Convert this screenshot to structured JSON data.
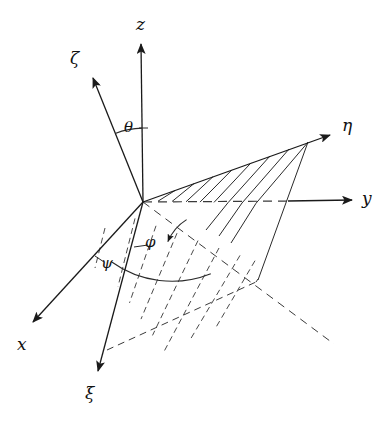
{
  "figure": {
    "kind": "euler-angles-diagram",
    "background_color": "#ffffff",
    "line_color": "#1a1a1a",
    "width": 392,
    "height": 421
  },
  "origin": {
    "x": 143,
    "y": 202
  },
  "axes": [
    {
      "id": "z",
      "label": "z",
      "frame": "fixed",
      "style": "solid",
      "from": {
        "x": 143,
        "y": 202
      },
      "to": {
        "x": 141,
        "y": 40
      },
      "label_pos": {
        "x": 136,
        "y": 16
      }
    },
    {
      "id": "y",
      "label": "y",
      "frame": "fixed",
      "style": "dashed-then-solid",
      "from": {
        "x": 143,
        "y": 202
      },
      "to": {
        "x": 355,
        "y": 200
      },
      "dash_end": {
        "x": 291,
        "y": 201
      },
      "label_pos": {
        "x": 362,
        "y": 190
      }
    },
    {
      "id": "x",
      "label": "x",
      "frame": "fixed",
      "style": "solid",
      "from": {
        "x": 143,
        "y": 202
      },
      "to": {
        "x": 30,
        "y": 325
      },
      "label_pos": {
        "x": 17,
        "y": 336
      }
    },
    {
      "id": "zeta",
      "label": "ζ",
      "frame": "body",
      "style": "solid",
      "from": {
        "x": 143,
        "y": 202
      },
      "to": {
        "x": 91,
        "y": 74
      },
      "label_pos": {
        "x": 70,
        "y": 50
      }
    },
    {
      "id": "eta",
      "label": "η",
      "frame": "body",
      "style": "solid",
      "from": {
        "x": 143,
        "y": 202
      },
      "to": {
        "x": 333,
        "y": 133
      },
      "label_pos": {
        "x": 342,
        "y": 117
      }
    },
    {
      "id": "xi",
      "label": "ξ",
      "frame": "body",
      "style": "solid",
      "from": {
        "x": 143,
        "y": 202
      },
      "to": {
        "x": 96,
        "y": 376
      },
      "label_pos": {
        "x": 85,
        "y": 385
      }
    }
  ],
  "angles": [
    {
      "id": "theta",
      "label": "θ",
      "between": [
        "zeta",
        "z"
      ],
      "label_pos": {
        "x": 124,
        "y": 120
      },
      "arc": {
        "cx": 143,
        "cy": 202,
        "r": 74,
        "from_deg": 248,
        "to_deg": 271
      }
    },
    {
      "id": "phi",
      "label": "φ",
      "between": [
        "line-of-nodes",
        "eta"
      ],
      "label_pos": {
        "x": 145,
        "y": 235
      },
      "arc": {
        "cx": 143,
        "cy": 202,
        "r": 47,
        "from_deg": 22,
        "to_deg": 58
      }
    },
    {
      "id": "psi",
      "label": "ψ",
      "between": [
        "x",
        "line-of-nodes"
      ],
      "label_pos": {
        "x": 101,
        "y": 256
      },
      "arc": {
        "cx": 143,
        "cy": 202,
        "r": 98,
        "from_deg": 47,
        "to_deg": 133
      }
    }
  ],
  "plane": {
    "id": "body-plane",
    "name": "xi-eta-plane",
    "hatched": true,
    "hatch_count": 9,
    "corners": [
      {
        "x": 143,
        "y": 202
      },
      {
        "x": 333,
        "y": 133
      },
      {
        "x": 256,
        "y": 282
      },
      {
        "x": 107,
        "y": 350
      }
    ],
    "upper_hatch_style": "solid",
    "lower_hatch_style": "dashed"
  },
  "node_line": {
    "id": "line-of-nodes",
    "style": "dashed",
    "from": {
      "x": 143,
      "y": 202
    },
    "to": {
      "x": 334,
      "y": 344
    }
  }
}
